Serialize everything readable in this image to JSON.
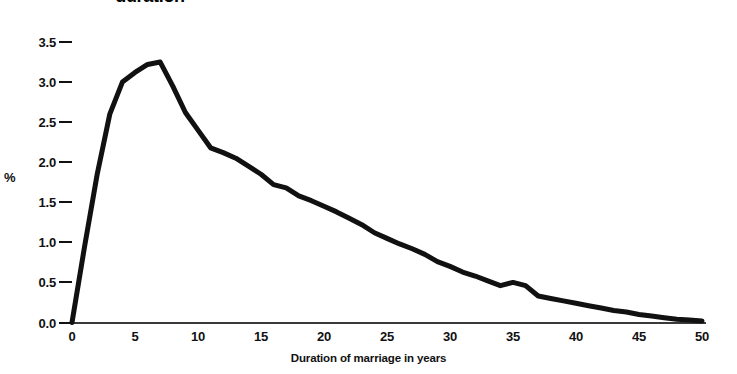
{
  "chart_data": {
    "type": "line",
    "title": "duration",
    "title_note": "title is clipped at the top edge of the screenshot; only the word 'duration' is visible",
    "xlabel": "Duration of marriage in years",
    "ylabel": "%",
    "xlim": [
      0,
      50
    ],
    "ylim": [
      0.0,
      3.5
    ],
    "xticks": [
      0,
      5,
      10,
      15,
      20,
      25,
      30,
      35,
      40,
      45,
      50
    ],
    "yticks": [
      "0.0",
      "0.5",
      "1.0",
      "1.5",
      "2.0",
      "2.5",
      "3.0",
      "3.5"
    ],
    "ytick_values": [
      0.0,
      0.5,
      1.0,
      1.5,
      2.0,
      2.5,
      3.0,
      3.5
    ],
    "grid": false,
    "legend": null,
    "line_color": "#111111",
    "line_width_px": 5,
    "x": [
      0,
      1,
      2,
      3,
      4,
      5,
      6,
      7,
      8,
      9,
      10,
      11,
      12,
      13,
      14,
      15,
      16,
      17,
      18,
      19,
      20,
      21,
      22,
      23,
      24,
      25,
      26,
      27,
      28,
      29,
      30,
      31,
      32,
      33,
      34,
      35,
      36,
      37,
      38,
      39,
      40,
      41,
      42,
      43,
      44,
      45,
      46,
      47,
      48,
      49,
      50
    ],
    "values": [
      0.0,
      0.95,
      1.85,
      2.6,
      3.0,
      3.12,
      3.22,
      3.25,
      2.95,
      2.62,
      2.4,
      2.18,
      2.12,
      2.05,
      1.95,
      1.85,
      1.72,
      1.68,
      1.58,
      1.52,
      1.45,
      1.38,
      1.3,
      1.22,
      1.12,
      1.05,
      0.98,
      0.92,
      0.85,
      0.76,
      0.7,
      0.63,
      0.58,
      0.52,
      0.46,
      0.5,
      0.46,
      0.33,
      0.3,
      0.27,
      0.24,
      0.21,
      0.18,
      0.15,
      0.13,
      0.1,
      0.08,
      0.06,
      0.04,
      0.03,
      0.02
    ],
    "annotations": [
      "peak plateau near 5-7 years at about 3.25%",
      "small shoulder near 16-17 years at about 1.7%",
      "local bump near 35 years at about 0.5%",
      "curve flattens toward 0 after 45 years"
    ]
  }
}
